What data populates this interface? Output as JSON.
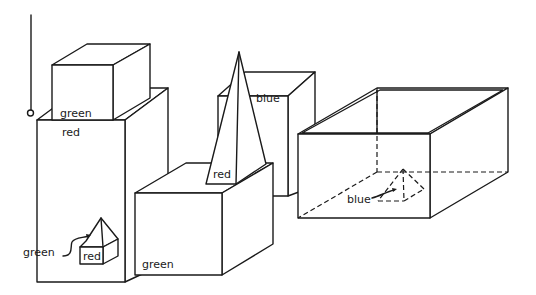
{
  "diagram": {
    "title": "",
    "objects": [
      {
        "id": "green-cube-top-left",
        "shape": "cube",
        "label": "green"
      },
      {
        "id": "red-tall-block",
        "shape": "block",
        "label": "red"
      },
      {
        "id": "red-small-house",
        "shape": "box-with-pyramid",
        "label": "red"
      },
      {
        "id": "green-small-pyramid",
        "shape": "pyramid",
        "label": "green"
      },
      {
        "id": "green-box-front",
        "shape": "box",
        "label": "green"
      },
      {
        "id": "red-tall-pyramid",
        "shape": "pyramid",
        "label": "red"
      },
      {
        "id": "blue-block",
        "shape": "block",
        "label": "blue"
      },
      {
        "id": "open-box",
        "shape": "open-box",
        "label": ""
      },
      {
        "id": "blue-pyramid-in-box",
        "shape": "pyramid",
        "label": "blue"
      }
    ],
    "labels": {
      "green_cube": "green",
      "red_block": "red",
      "small_red": "red",
      "small_green": "green",
      "green_box": "green",
      "red_pyramid": "red",
      "blue_block": "blue",
      "blue_pyramid": "blue"
    },
    "hand": {
      "shape": "vertical-line-with-circle"
    }
  }
}
